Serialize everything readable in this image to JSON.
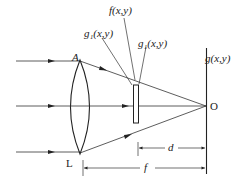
{
  "diagram": {
    "type": "optics-fourier-transform-setup",
    "labels": {
      "lens_top": "A",
      "lens_bottom": "L",
      "object_transmittance": "f(x,y)",
      "incident_field": "g₁(x,y)",
      "exit_field": "g₁(x,y)",
      "output_plane": "g(x,y)",
      "focal_point": "O",
      "distance_d": "d",
      "focal_length": "f"
    },
    "elements": [
      {
        "name": "incoming-parallel-rays",
        "count": 3
      },
      {
        "name": "converging-lens",
        "label": "L"
      },
      {
        "name": "object-plate",
        "label": "f(x,y)"
      },
      {
        "name": "output-screen",
        "label": "g(x,y)"
      }
    ],
    "colors": {
      "stroke": "#222222",
      "background": "#ffffff"
    }
  }
}
